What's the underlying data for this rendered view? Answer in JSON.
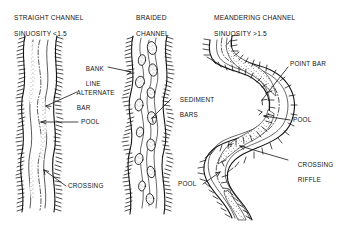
{
  "figure": {
    "kind": "river-channel-pattern-diagram",
    "background_color": "#ffffff",
    "ink_color": "#141414"
  },
  "panels": [
    {
      "id": "straight",
      "title_line1": "STRAIGHT CHANNEL",
      "title_line2": "SINUOSITY <1.5"
    },
    {
      "id": "braided",
      "title_line1": "BRAIDED",
      "title_line2": "CHANNEL"
    },
    {
      "id": "meandering",
      "title_line1": "MEANDERING CHANNEL",
      "title_line2": "SINUOSITY >1.5"
    }
  ],
  "annotations": {
    "bank_line": "BANK\nLINE",
    "bank_line_l1": "BANK",
    "bank_line_l2": "LINE",
    "alternate_bar_l1": "ALTERNATE",
    "alternate_bar_l2": "BAR",
    "sediment_bars_l1": "SEDIMENT",
    "sediment_bars_l2": "BARS",
    "pool_straight": "POOL",
    "crossing_straight": "CROSSING",
    "point_bar": "POINT BAR",
    "pool_meander_right": "POOL",
    "crossing_riffle_l1": "CROSSING",
    "crossing_riffle_l2": "RIFFLE",
    "pool_meander_left": "POOL"
  }
}
